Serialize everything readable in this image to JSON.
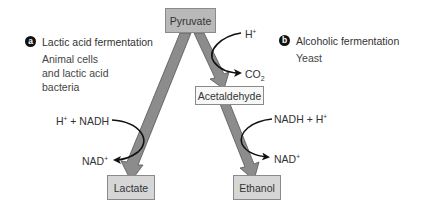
{
  "colors": {
    "flow_arrow_fill": "#8c8c8c",
    "flow_arrow_stroke": "#555555",
    "box_dark": "#b9b9b9",
    "box_light": "#f7f7f7",
    "cofactor_arrow": "#111111",
    "badge": "#111111"
  },
  "panel_a": {
    "badge": "a",
    "title": "Lactic acid fermentation",
    "organisms": [
      "Animal cells",
      "and lactic acid",
      "bacteria"
    ]
  },
  "panel_b": {
    "badge": "b",
    "title": "Alcoholic fermentation",
    "organisms": [
      "Yeast"
    ]
  },
  "nodes": {
    "pyruvate": "Pyruvate",
    "acetaldehyde": "Acetaldehyde",
    "lactate": "Lactate",
    "ethanol": "Ethanol"
  },
  "cofactors": {
    "lactic_in": {
      "base": "H",
      "sup": "+",
      "rest": " + NADH"
    },
    "lactic_out": {
      "base": "NAD",
      "sup": "+"
    },
    "alc_step1_in": {
      "base": "H",
      "sup": "+"
    },
    "alc_step1_out": {
      "base": "CO",
      "sub": "2"
    },
    "alc_step2_in": {
      "base": "NADH + H",
      "sup": "+"
    },
    "alc_step2_out": {
      "base": "NAD",
      "sup": "+"
    }
  },
  "edges": [
    {
      "from": "Pyruvate",
      "to": "Lactate"
    },
    {
      "from": "Pyruvate",
      "to": "Acetaldehyde"
    },
    {
      "from": "Acetaldehyde",
      "to": "Ethanol"
    }
  ]
}
